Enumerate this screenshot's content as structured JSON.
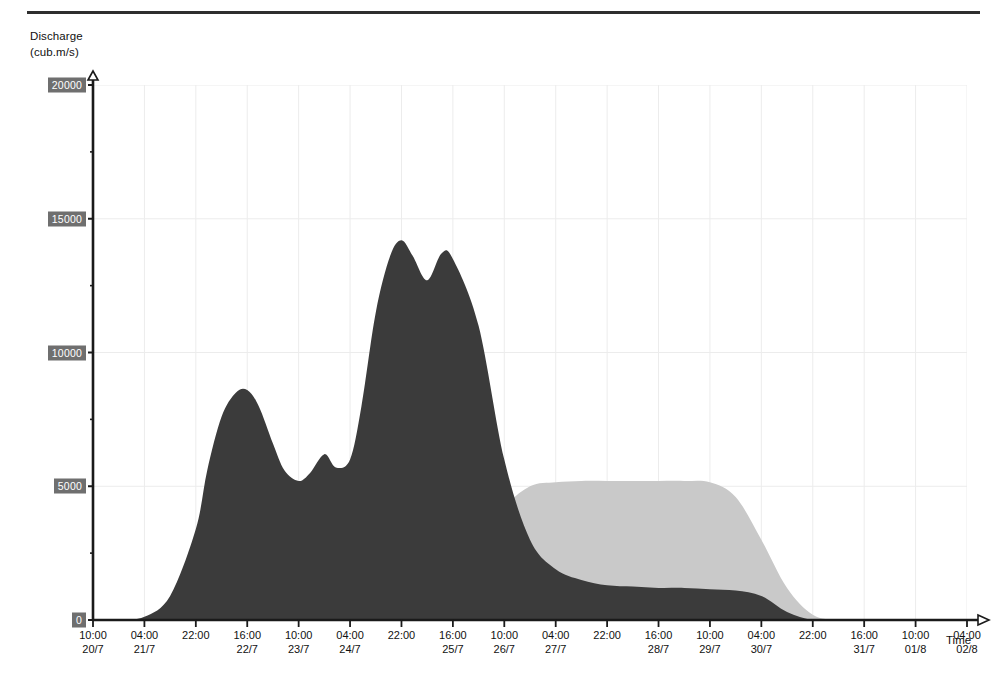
{
  "figure": {
    "y_axis_title_line1": "Discharge",
    "y_axis_title_line2": "(cub.m/s)",
    "x_axis_title": "Time"
  },
  "chart_data": {
    "type": "area",
    "title": "",
    "subtitle": "",
    "xlabel": "Time",
    "ylabel": "Discharge (cub.m/s)",
    "ylim": [
      0,
      20000
    ],
    "y_ticks": [
      0,
      5000,
      10000,
      15000,
      20000
    ],
    "y_tick_labels": [
      "0",
      "5000",
      "10000",
      "15000",
      "20000"
    ],
    "y_minor_tick_step": 2500,
    "grid": "faint vertical gridlines at every major x tick, faint horizontal gridlines at 5000/10000/15000",
    "legend": "none",
    "x_tick_labels": [
      {
        "time": "10:00",
        "date": "20/7"
      },
      {
        "time": "04:00",
        "date": "21/7"
      },
      {
        "time": "22:00",
        "date": ""
      },
      {
        "time": "16:00",
        "date": "22/7"
      },
      {
        "time": "10:00",
        "date": "23/7"
      },
      {
        "time": "04:00",
        "date": "24/7"
      },
      {
        "time": "22:00",
        "date": ""
      },
      {
        "time": "16:00",
        "date": "25/7"
      },
      {
        "time": "10:00",
        "date": "26/7"
      },
      {
        "time": "04:00",
        "date": "27/7"
      },
      {
        "time": "22:00",
        "date": ""
      },
      {
        "time": "16:00",
        "date": "28/7"
      },
      {
        "time": "10:00",
        "date": "29/7"
      },
      {
        "time": "04:00",
        "date": "30/7"
      },
      {
        "time": "22:00",
        "date": ""
      },
      {
        "time": "16:00",
        "date": "31/7"
      },
      {
        "time": "10:00",
        "date": "01/8"
      },
      {
        "time": "04:00",
        "date": "02/8"
      }
    ],
    "x_tick_hours_step": 18,
    "x_range_hours": [
      0,
      306
    ],
    "colors": {
      "series_dark": "#3b3b3b",
      "series_medium": "#5f5f5f",
      "series_light": "#c9c9c9",
      "axis": "#1a1a1a",
      "gridline": "#ececec",
      "tick_label_box": "#6f6f6f",
      "tick_label_text": "#ffffff"
    },
    "series": [
      {
        "name": "series-light",
        "color": "#c9c9c9",
        "draw_order": 1,
        "x": [
          0,
          18,
          36,
          54,
          72,
          90,
          99,
          108,
          117,
          126,
          135,
          144,
          153,
          162,
          171,
          180,
          189,
          198,
          207,
          216,
          225,
          234,
          243,
          252,
          261,
          270,
          279,
          288,
          297,
          306
        ],
        "values": [
          0,
          0,
          0,
          0,
          0,
          0,
          0,
          150,
          600,
          1500,
          2800,
          4200,
          5000,
          5150,
          5200,
          5200,
          5200,
          5200,
          5200,
          5150,
          4600,
          3000,
          1200,
          200,
          0,
          0,
          0,
          0,
          0,
          0
        ]
      },
      {
        "name": "series-medium",
        "color": "#5f5f5f",
        "draw_order": 2,
        "x": [
          0,
          9,
          18,
          27,
          36,
          45,
          54,
          63,
          72,
          81,
          90,
          99,
          108,
          117,
          126,
          135,
          144,
          153,
          162,
          171,
          180,
          189,
          198,
          207,
          216,
          225,
          234,
          243,
          252,
          261,
          270,
          279,
          288,
          297,
          306
        ],
        "values": [
          0,
          0,
          40,
          250,
          900,
          1900,
          2700,
          3000,
          2900,
          3300,
          4200,
          5600,
          6500,
          6550,
          6100,
          4200,
          2500,
          1500,
          1000,
          800,
          750,
          750,
          750,
          750,
          750,
          700,
          500,
          150,
          0,
          0,
          0,
          0,
          0,
          0,
          0
        ]
      },
      {
        "name": "series-dark",
        "color": "#3b3b3b",
        "draw_order": 3,
        "x": [
          0,
          9,
          18,
          27,
          36,
          40,
          45,
          50,
          54,
          58,
          63,
          67,
          72,
          76,
          81,
          85,
          90,
          94,
          99,
          104,
          108,
          112,
          117,
          122,
          126,
          135,
          144,
          153,
          162,
          171,
          180,
          189,
          198,
          207,
          216,
          225,
          234,
          243,
          252,
          261,
          270,
          279,
          288,
          297,
          306
        ],
        "values": [
          0,
          0,
          120,
          900,
          3400,
          5600,
          7600,
          8500,
          8600,
          8000,
          6600,
          5600,
          5200,
          5500,
          6200,
          5700,
          6000,
          8000,
          11500,
          13600,
          14200,
          13600,
          12700,
          13700,
          13500,
          11000,
          6000,
          3000,
          1900,
          1500,
          1300,
          1250,
          1200,
          1200,
          1150,
          1100,
          900,
          300,
          0,
          0,
          0,
          0,
          0,
          0,
          0
        ]
      }
    ],
    "peaks": {
      "series_dark_first_peak": {
        "value": 8600,
        "approx_time": "16:00 22/7"
      },
      "series_dark_main_peak": {
        "value": 14200,
        "approx_time": "04:00 24/7"
      },
      "series_dark_secondary_peak": {
        "value": 13700,
        "approx_time": "22:00 24/7"
      },
      "series_medium_peak": {
        "value": 6550,
        "approx_time": "04:00 24/7"
      },
      "series_light_plateau": {
        "value": 5200,
        "approx_range": "16:00 25/7 to 16:00 28/7"
      }
    }
  }
}
